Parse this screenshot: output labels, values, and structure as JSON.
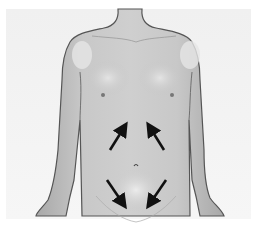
{
  "figure": {
    "caption": "Arrows indicating direction toward umbilicus",
    "colors": {
      "background": "#f2f2f2",
      "skin": "#b9b9b9",
      "skin_highlight": "#e2e2e2",
      "outline": "#555555",
      "arrow": "#111111"
    },
    "arrows": [
      {
        "name": "upper-left-arrow",
        "direction": "up-right"
      },
      {
        "name": "upper-right-arrow",
        "direction": "up-left"
      },
      {
        "name": "lower-left-arrow",
        "direction": "down-right"
      },
      {
        "name": "lower-right-arrow",
        "direction": "down-left"
      }
    ]
  }
}
